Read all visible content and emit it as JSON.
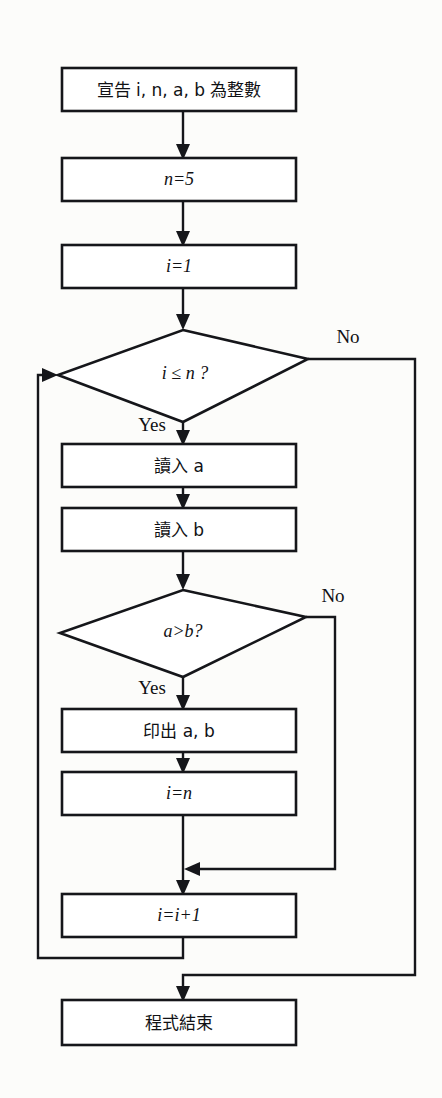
{
  "diagram": {
    "language": "zh-Hant",
    "stroke_color": "#15161a",
    "fill_color": "#ffffff",
    "background_color": "#fcfcfa",
    "nodes": [
      {
        "id": "declare",
        "type": "process",
        "label": "宣告 i, n, a, b 為整數",
        "x": 62,
        "y": 68,
        "w": 234,
        "h": 43
      },
      {
        "id": "set_n",
        "type": "process",
        "label": "n=5",
        "x": 62,
        "y": 158,
        "w": 234,
        "h": 43
      },
      {
        "id": "set_i",
        "type": "process",
        "label": "i=1",
        "x": 62,
        "y": 245,
        "w": 234,
        "h": 43
      },
      {
        "id": "cond_loop",
        "type": "decision",
        "label": "i ≤ n ?",
        "cx": 183,
        "cy": 375,
        "rx": 125,
        "ry": 47
      },
      {
        "id": "read_a",
        "type": "process",
        "label": "讀入 a",
        "x": 62,
        "y": 444,
        "w": 234,
        "h": 43
      },
      {
        "id": "read_b",
        "type": "process",
        "label": "讀入 b",
        "x": 62,
        "y": 508,
        "w": 234,
        "h": 43
      },
      {
        "id": "cond_cmp",
        "type": "decision",
        "label": "a>b?",
        "cx": 183,
        "cy": 633,
        "rx": 123,
        "ry": 44
      },
      {
        "id": "print_ab",
        "type": "process",
        "label": "印出 a, b",
        "x": 62,
        "y": 709,
        "w": 234,
        "h": 43
      },
      {
        "id": "set_i_n",
        "type": "process",
        "label": "i=n",
        "x": 62,
        "y": 772,
        "w": 234,
        "h": 43
      },
      {
        "id": "inc_i",
        "type": "process",
        "label": "i=i+1",
        "x": 62,
        "y": 894,
        "w": 234,
        "h": 43
      },
      {
        "id": "end",
        "type": "process",
        "label": "程式結束",
        "x": 62,
        "y": 1000,
        "w": 234,
        "h": 45
      }
    ],
    "edge_labels": [
      {
        "id": "loop_no",
        "text": "No",
        "x": 348,
        "y": 339
      },
      {
        "id": "loop_yes",
        "text": "Yes",
        "x": 152,
        "y": 427
      },
      {
        "id": "cmp_no",
        "text": "No",
        "x": 333,
        "y": 598
      },
      {
        "id": "cmp_yes",
        "text": "Yes",
        "x": 152,
        "y": 690
      }
    ],
    "edges": [
      {
        "from": "declare",
        "to": "set_n"
      },
      {
        "from": "set_n",
        "to": "set_i"
      },
      {
        "from": "set_i",
        "to": "cond_loop"
      },
      {
        "from": "cond_loop",
        "to": "read_a",
        "label": "Yes"
      },
      {
        "from": "cond_loop",
        "to": "end",
        "label": "No"
      },
      {
        "from": "read_a",
        "to": "read_b"
      },
      {
        "from": "read_b",
        "to": "cond_cmp"
      },
      {
        "from": "cond_cmp",
        "to": "print_ab",
        "label": "Yes"
      },
      {
        "from": "cond_cmp",
        "to": "inc_i",
        "label": "No"
      },
      {
        "from": "print_ab",
        "to": "set_i_n"
      },
      {
        "from": "set_i_n",
        "to": "inc_i"
      },
      {
        "from": "inc_i",
        "to": "cond_loop"
      }
    ]
  }
}
